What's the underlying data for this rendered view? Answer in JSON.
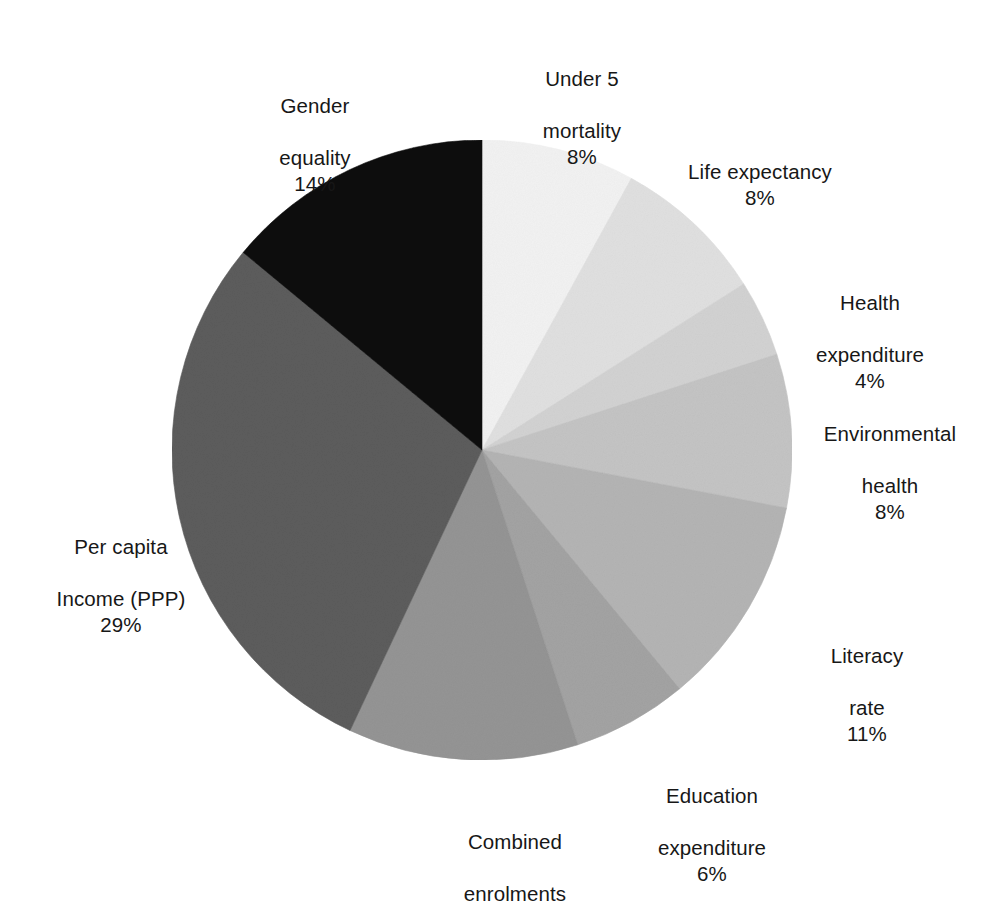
{
  "chart_data": {
    "type": "pie",
    "title": "",
    "xlabel": "",
    "ylabel": "",
    "legend_position": "none",
    "grid": false,
    "value_unit": "%",
    "start_angle_deg": 0,
    "direction": "clockwise",
    "categories": [
      "Under 5 mortality",
      "Life expectancy",
      "Health expenditure",
      "Environmental health",
      "Literacy rate",
      "Education expenditure",
      "Combined enrolments",
      "Per capita Income (PPP)",
      "Gender equality"
    ],
    "values": [
      8,
      8,
      4,
      8,
      11,
      6,
      12,
      29,
      14
    ],
    "colors": [
      "#f2f2f2",
      "#e0e0e0",
      "#d2d2d2",
      "#c4c4c4",
      "#b4b4b4",
      "#a3a3a3",
      "#949494",
      "#5c5c5c",
      "#0d0d0d"
    ],
    "slices": [
      {
        "label": "Under 5 mortality",
        "label_line1": "Under 5",
        "label_line2": "mortality",
        "value": 8,
        "value_text": "8%",
        "color": "#f2f2f2"
      },
      {
        "label": "Life expectancy",
        "label_line1": "Life expectancy",
        "label_line2": "",
        "value": 8,
        "value_text": "8%",
        "color": "#e0e0e0"
      },
      {
        "label": "Health expenditure",
        "label_line1": "Health",
        "label_line2": "expenditure",
        "value": 4,
        "value_text": "4%",
        "color": "#d2d2d2"
      },
      {
        "label": "Environmental health",
        "label_line1": "Environmental",
        "label_line2": "health",
        "value": 8,
        "value_text": "8%",
        "color": "#c4c4c4"
      },
      {
        "label": "Literacy rate",
        "label_line1": "Literacy",
        "label_line2": "rate",
        "value": 11,
        "value_text": "11%",
        "color": "#b4b4b4"
      },
      {
        "label": "Education expenditure",
        "label_line1": "Education",
        "label_line2": "expenditure",
        "value": 6,
        "value_text": "6%",
        "color": "#a3a3a3"
      },
      {
        "label": "Combined enrolments",
        "label_line1": "Combined",
        "label_line2": "enrolments",
        "value": 12,
        "value_text": "",
        "color": "#949494"
      },
      {
        "label": "Per capita Income (PPP)",
        "label_line1": "Per capita",
        "label_line2": "Income (PPP)",
        "value": 29,
        "value_text": "29%",
        "color": "#5c5c5c"
      },
      {
        "label": "Gender equality",
        "label_line1": "Gender",
        "label_line2": "equality",
        "value": 14,
        "value_text": "14%",
        "color": "#0d0d0d"
      }
    ]
  },
  "labels": {
    "under5": {
      "line1": "Under 5",
      "line2": "mortality",
      "pct": "8%"
    },
    "life": {
      "line1": "Life expectancy",
      "line2": "",
      "pct": "8%"
    },
    "healthexp": {
      "line1": "Health",
      "line2": "expenditure",
      "pct": "4%"
    },
    "envhealth": {
      "line1": "Environmental",
      "line2": "health",
      "pct": "8%"
    },
    "literacy": {
      "line1": "Literacy",
      "line2": "rate",
      "pct": "11%"
    },
    "education": {
      "line1": "Education",
      "line2": "expenditure",
      "pct": "6%"
    },
    "combined": {
      "line1": "Combined",
      "line2": "enrolments",
      "pct": ""
    },
    "percapita": {
      "line1": "Per capita",
      "line2": "Income (PPP)",
      "pct": "29%"
    },
    "gender": {
      "line1": "Gender",
      "line2": "equality",
      "pct": "14%"
    }
  },
  "geometry": {
    "center_x": 482,
    "center_y": 450,
    "radius": 310
  }
}
